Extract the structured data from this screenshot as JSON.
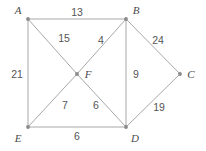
{
  "diagram": {
    "canvas": {
      "width": 206,
      "height": 151
    },
    "colors": {
      "background": "#ffffff",
      "edge": "#a8a8a8",
      "vertex": "#8a8a8a",
      "vertex_label": "#4a4a4a",
      "weight_label": "#555555"
    },
    "vertices": [
      {
        "id": "A",
        "label": "A",
        "x": 28,
        "y": 19,
        "label_x": 18,
        "label_y": 10
      },
      {
        "id": "B",
        "label": "B",
        "x": 126,
        "y": 19,
        "label_x": 136,
        "label_y": 10
      },
      {
        "id": "C",
        "label": "C",
        "x": 180,
        "y": 74,
        "label_x": 191,
        "label_y": 74
      },
      {
        "id": "D",
        "label": "D",
        "x": 126,
        "y": 127,
        "label_x": 135,
        "label_y": 138
      },
      {
        "id": "E",
        "label": "E",
        "x": 28,
        "y": 127,
        "label_x": 18,
        "label_y": 138
      },
      {
        "id": "F",
        "label": "F",
        "x": 77,
        "y": 74,
        "label_x": 88,
        "label_y": 74
      }
    ],
    "edges": [
      {
        "id": "AB",
        "from": "A",
        "to": "B",
        "weight": "13",
        "label_x": 77,
        "label_y": 12
      },
      {
        "id": "AF",
        "from": "A",
        "to": "F",
        "weight": "15",
        "label_x": 64,
        "label_y": 38
      },
      {
        "id": "BF",
        "from": "B",
        "to": "F",
        "weight": "4",
        "label_x": 101,
        "label_y": 40
      },
      {
        "id": "BC",
        "from": "B",
        "to": "C",
        "weight": "24",
        "label_x": 158,
        "label_y": 40
      },
      {
        "id": "BD",
        "from": "B",
        "to": "D",
        "weight": "9",
        "label_x": 136,
        "label_y": 74
      },
      {
        "id": "AE",
        "from": "A",
        "to": "E",
        "weight": "21",
        "label_x": 17,
        "label_y": 74
      },
      {
        "id": "EF",
        "from": "E",
        "to": "F",
        "weight": "7",
        "label_x": 65,
        "label_y": 105
      },
      {
        "id": "FD",
        "from": "F",
        "to": "D",
        "weight": "6",
        "label_x": 96,
        "label_y": 105
      },
      {
        "id": "CD",
        "from": "C",
        "to": "D",
        "weight": "19",
        "label_x": 159,
        "label_y": 107
      },
      {
        "id": "ED",
        "from": "E",
        "to": "D",
        "weight": "6",
        "label_x": 77,
        "label_y": 136
      }
    ]
  }
}
